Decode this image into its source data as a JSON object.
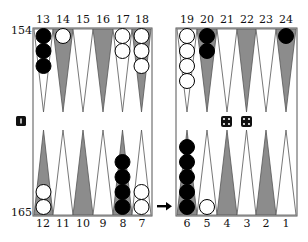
{
  "board": {
    "top_labels_left": [
      "13",
      "14",
      "15",
      "16",
      "17",
      "18"
    ],
    "top_labels_right": [
      "19",
      "20",
      "21",
      "22",
      "23",
      "24"
    ],
    "bottom_labels_left": [
      "12",
      "11",
      "10",
      "9",
      "8",
      "7"
    ],
    "bottom_labels_right": [
      "6",
      "5",
      "4",
      "3",
      "2",
      "1"
    ],
    "pip_top": "154",
    "pip_bottom": "165",
    "cube_value": "1",
    "dice": [
      4,
      4
    ],
    "turn_arrow": "right-arrow"
  },
  "colors": {
    "dark_point": "#8c8c8c",
    "light_point": "#ffffff",
    "black_checker": "#000000",
    "white_checker": "#ffffff",
    "border": "#555555"
  },
  "checkers": {
    "13": {
      "color": "black",
      "count": 3
    },
    "14": {
      "color": "white",
      "count": 1
    },
    "17": {
      "color": "white",
      "count": 2
    },
    "18": {
      "color": "white",
      "count": 3
    },
    "19": {
      "color": "white",
      "count": 4
    },
    "20": {
      "color": "black",
      "count": 2
    },
    "24": {
      "color": "black",
      "count": 1
    },
    "12": {
      "color": "white",
      "count": 2
    },
    "8": {
      "color": "black",
      "count": 4
    },
    "7": {
      "color": "white",
      "count": 2
    },
    "6": {
      "color": "black",
      "count": 5
    },
    "5": {
      "color": "white",
      "count": 1
    }
  }
}
